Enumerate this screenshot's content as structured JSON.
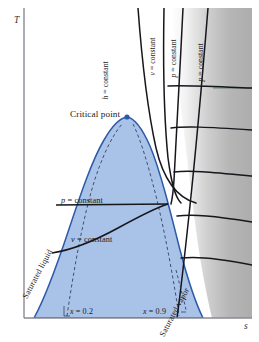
{
  "figure": {
    "type": "T-s diagram (temperature-entropy) for a pure substance",
    "axes": {
      "y_label": "T",
      "x_label": "s"
    },
    "colors": {
      "dome_fill": "#a9c2e8",
      "dome_stroke": "#2d5aa8",
      "curve_stroke": "#16161c",
      "gray_region": "#b3b3b3",
      "frame": "#8a8a92",
      "green_line": "#4a7a55",
      "text": "#1a1a22"
    },
    "annotations": {
      "critical_point": "Critical point",
      "saturated_liquid": "Saturated liquid",
      "saturated_vapor": "Saturated vapor",
      "p_constant_dome": "p = constant",
      "v_constant_dome": "v = constant",
      "quality_low": "x = 0.2",
      "quality_high": "x = 0.9"
    },
    "superheat_labels": [
      {
        "id": "h-constant",
        "text": "h = constant"
      },
      {
        "id": "v-constant",
        "text": "v = constant"
      },
      {
        "id": "p-constant-1",
        "text": "p = constant"
      },
      {
        "id": "p-constant-2",
        "text": "p = constant"
      }
    ]
  }
}
